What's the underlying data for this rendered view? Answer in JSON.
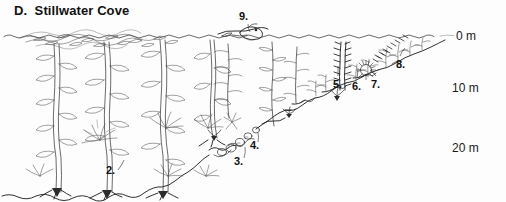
{
  "figure": {
    "panel_letter": "D.",
    "title": "D.  Stillwater Cove",
    "title_text": "Stillwater Cove",
    "type": "scientific-illustration",
    "style": "black-and-white pen-and-ink line drawing",
    "background_color": "#fdfdfd",
    "ink_color": "#2b2b2b"
  },
  "depth_axis": {
    "unit": "m",
    "labels": [
      {
        "text": "0 m",
        "depth": 0
      },
      {
        "text": "10 m",
        "depth": 10
      },
      {
        "text": "20 m",
        "depth": 20
      }
    ]
  },
  "callouts": [
    {
      "id": "2",
      "text": "2."
    },
    {
      "id": "3",
      "text": "3."
    },
    {
      "id": "4",
      "text": "4."
    },
    {
      "id": "5",
      "text": "5."
    },
    {
      "id": "6",
      "text": "6."
    },
    {
      "id": "7",
      "text": "7."
    },
    {
      "id": "8",
      "text": "8."
    },
    {
      "id": "9",
      "text": "9."
    }
  ],
  "scene": {
    "water_surface": "wavy waterline across full width",
    "seafloor": "rocky bottom sloping up from deep left to shallow right",
    "left_zone": "tall giant kelp stipes with blades forming canopy",
    "right_zone": "shallow rocky reef with short algae turf and invertebrates",
    "surface_animal": "sea otter floating on back at surface"
  }
}
